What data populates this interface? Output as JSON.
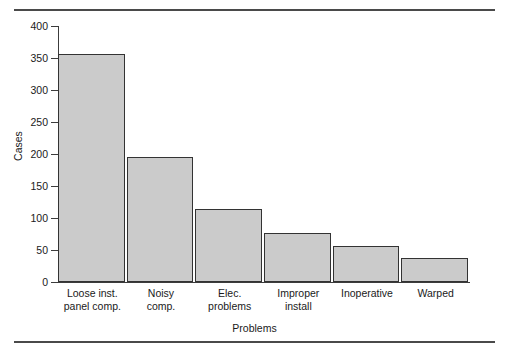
{
  "chart_data": {
    "type": "bar",
    "title": "",
    "xlabel": "Problems",
    "ylabel": "Cases",
    "categories": [
      "Loose inst.\npanel comp.",
      "Noisy\ncomp.",
      "Elec.\nproblems",
      "Improper\ninstall",
      "Inoperative",
      "Warped"
    ],
    "values": [
      357,
      196,
      114,
      76,
      56,
      38
    ],
    "ylim": [
      0,
      400
    ],
    "yticks": [
      0,
      50,
      100,
      150,
      200,
      250,
      300,
      350,
      400
    ],
    "ytick_labels": [
      "0",
      "50",
      "100",
      "150",
      "200",
      "250",
      "300",
      "350",
      "400"
    ],
    "grid": false,
    "legend": null,
    "bar_fill_color": "#cbcbcb",
    "bar_edge_color": "#333333",
    "axis_color": "#3c3c3c",
    "rule_color": "#4a4a4a",
    "background_color": "#ffffff"
  },
  "figure": {
    "top_rule": "",
    "bottom_rule": ""
  }
}
